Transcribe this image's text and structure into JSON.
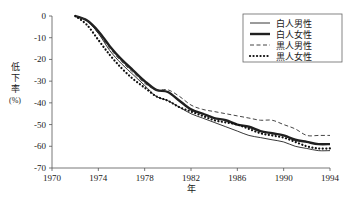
{
  "chart_data": {
    "type": "line",
    "title": "",
    "xlabel": "年",
    "ylabel": "低下率\n(%)",
    "ylabel_chars": [
      "低",
      "下",
      "率"
    ],
    "ylabel_unit": "(%)",
    "xlim": [
      1970,
      1994
    ],
    "ylim": [
      -70,
      0
    ],
    "xticks": [
      1970,
      1974,
      1978,
      1982,
      1986,
      1990,
      1994
    ],
    "yticks": [
      0,
      -10,
      -20,
      -30,
      -40,
      -50,
      -60,
      -70
    ],
    "xtick_labels": [
      "1970",
      "1974",
      "1978",
      "1982",
      "1986",
      "1990",
      "1994"
    ],
    "ytick_labels": [
      "0",
      "-10",
      "-20",
      "-30",
      "-40",
      "-50",
      "-60",
      "-70"
    ],
    "grid": false,
    "legend_position": "top-right",
    "x": [
      1972,
      1973,
      1974,
      1975,
      1976,
      1977,
      1978,
      1979,
      1980,
      1981,
      1982,
      1983,
      1984,
      1985,
      1986,
      1987,
      1988,
      1989,
      1990,
      1991,
      1992,
      1993,
      1994
    ],
    "series": [
      {
        "name": "白人男性",
        "style": "solid-thin",
        "color": "#202020",
        "values": [
          0,
          -2,
          -8,
          -16,
          -22,
          -27,
          -32,
          -37,
          -39,
          -42,
          -45,
          -47,
          -49,
          -51,
          -53,
          -55,
          -56,
          -57,
          -58,
          -60,
          -61,
          -62,
          -62
        ]
      },
      {
        "name": "白人女性",
        "style": "solid-thick",
        "color": "#202020",
        "values": [
          0,
          -2,
          -7,
          -14,
          -20,
          -25,
          -30,
          -34,
          -35,
          -39,
          -43,
          -45,
          -47,
          -48,
          -50,
          -51,
          -53,
          -54,
          -55,
          -57,
          -58,
          -59,
          -59
        ]
      },
      {
        "name": "黒人男性",
        "style": "dashed",
        "color": "#303030",
        "values": [
          0,
          -2,
          -8,
          -15,
          -21,
          -26,
          -31,
          -34,
          -34,
          -37,
          -41,
          -43,
          -44,
          -45,
          -46,
          -47,
          -48,
          -48,
          -50,
          -52,
          -55,
          -55,
          -55
        ]
      },
      {
        "name": "黒人女性",
        "style": "dotted",
        "color": "#101010",
        "values": [
          0,
          -4,
          -11,
          -18,
          -24,
          -29,
          -33,
          -37,
          -39,
          -42,
          -44,
          -46,
          -48,
          -49,
          -50,
          -52,
          -54,
          -55,
          -56,
          -58,
          -60,
          -61,
          -61
        ]
      }
    ]
  },
  "legend": {
    "entries": [
      {
        "label": "白人男性",
        "swatch": "solid-thin-swatch"
      },
      {
        "label": "白人女性",
        "swatch": "solid-thick-swatch"
      },
      {
        "label": "黒人男性",
        "swatch": "dashed-swatch"
      },
      {
        "label": "黒人女性",
        "swatch": "dotted-swatch"
      }
    ]
  }
}
